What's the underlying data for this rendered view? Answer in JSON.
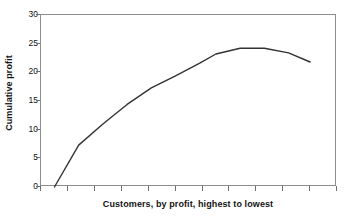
{
  "chart_data": {
    "type": "line",
    "title": "",
    "xlabel": "Customers, by profit, highest to lowest",
    "ylabel": "Cumulative profit",
    "ylim": [
      0,
      30
    ],
    "xlim": [
      0,
      11
    ],
    "yticks": [
      0,
      5,
      10,
      15,
      20,
      25,
      30
    ],
    "ytick_labels": [
      "0",
      "5",
      "10",
      "15",
      "20",
      "25",
      "30"
    ],
    "xtick_labels": [],
    "xtick_count": 11,
    "grid": false,
    "legend": false,
    "line_color": "#333333",
    "frame_color": "#8d8d8d",
    "series": [
      {
        "name": "Cumulative profit",
        "x": [
          0.5,
          1.4,
          2.3,
          3.2,
          4.1,
          5.0,
          5.9,
          6.5,
          7.4,
          8.3,
          9.2,
          10.0
        ],
        "values": [
          0,
          7.3,
          11.0,
          14.4,
          17.3,
          19.4,
          21.6,
          23.2,
          24.2,
          24.2,
          23.4,
          21.8
        ]
      }
    ]
  }
}
